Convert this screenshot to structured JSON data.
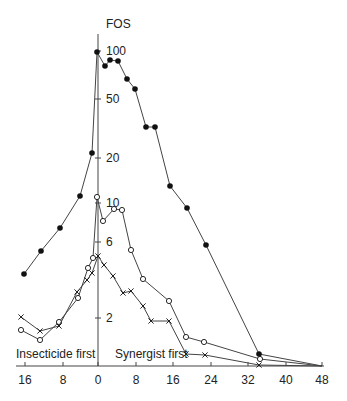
{
  "chart_data": {
    "type": "line",
    "title": "",
    "ylabel": "FOS",
    "xlabel": "",
    "yscale": "log",
    "ylim": [
      0.85,
      110
    ],
    "xlim": [
      -17,
      48
    ],
    "y_ticks": [
      {
        "value": 100,
        "label": "100",
        "py": 51
      },
      {
        "value": 50,
        "label": "50",
        "py": 99
      },
      {
        "value": 20,
        "label": "20",
        "py": 158
      },
      {
        "value": 10,
        "label": "10",
        "py": 203
      },
      {
        "value": 6,
        "label": "6",
        "py": 242
      },
      {
        "value": 2,
        "label": "2",
        "py": 318
      }
    ],
    "x_ticks": [
      {
        "value": -16,
        "label": "16",
        "px": 25
      },
      {
        "value": -8,
        "label": "8",
        "px": 63
      },
      {
        "value": 0,
        "label": "0",
        "px": 98
      },
      {
        "value": 8,
        "label": "8",
        "px": 136
      },
      {
        "value": 16,
        "label": "16",
        "px": 173
      },
      {
        "value": 24,
        "label": "24",
        "px": 211
      },
      {
        "value": 32,
        "label": "32",
        "px": 248
      },
      {
        "value": 40,
        "label": "40",
        "px": 286
      },
      {
        "value": 48,
        "label": "48",
        "px": 322
      }
    ],
    "annotations": [
      {
        "text": "Insecticide first",
        "region": "x < 0"
      },
      {
        "text": "Synergist first",
        "region": "x > 0"
      }
    ],
    "grid": false,
    "legend": null,
    "series": [
      {
        "name": "filled-circles",
        "marker": "filled-circle",
        "x": [
          -16,
          -12,
          -8,
          -4,
          -1,
          0,
          1.5,
          2.5,
          4,
          6,
          8,
          10,
          12,
          15,
          19,
          23,
          34,
          48
        ],
        "values": [
          3.4,
          4.8,
          6.9,
          11,
          21,
          100,
          80,
          87,
          86,
          65,
          56,
          32,
          32,
          13,
          9.3,
          5.3,
          1.0,
          0.85
        ],
        "px": [
          [
            24,
            274
          ],
          [
            41,
            251
          ],
          [
            60,
            228
          ],
          [
            80,
            196
          ],
          [
            92,
            153
          ],
          [
            97,
            52
          ],
          [
            105,
            66
          ],
          [
            110,
            60
          ],
          [
            118,
            61
          ],
          [
            127,
            79
          ],
          [
            135,
            89
          ],
          [
            146,
            127
          ],
          [
            155,
            127
          ],
          [
            170,
            186
          ],
          [
            187,
            208
          ],
          [
            206,
            245
          ],
          [
            259,
            354
          ],
          [
            322,
            366
          ]
        ]
      },
      {
        "name": "open-circles",
        "marker": "open-circle",
        "x": [
          -16,
          -12,
          -8,
          -4,
          -2,
          -1,
          0,
          1.5,
          3.5,
          5,
          7,
          9.5,
          15,
          19,
          23,
          34,
          48
        ],
        "values": [
          1.5,
          1.26,
          1.6,
          2.4,
          3.7,
          4.3,
          11,
          7.6,
          9.1,
          9.0,
          4.9,
          3.1,
          2.3,
          1.3,
          1.2,
          0.94,
          0.85
        ],
        "px": [
          [
            21,
            330
          ],
          [
            40,
            340
          ],
          [
            59,
            322
          ],
          [
            78,
            298
          ],
          [
            88,
            268
          ],
          [
            93,
            258
          ],
          [
            97,
            197
          ],
          [
            103,
            221
          ],
          [
            114,
            209
          ],
          [
            122,
            210
          ],
          [
            131,
            250
          ],
          [
            143,
            279
          ],
          [
            169,
            301
          ],
          [
            186,
            337
          ],
          [
            204,
            342
          ],
          [
            260,
            359
          ],
          [
            322,
            366
          ]
        ]
      },
      {
        "name": "crosses",
        "marker": "cross",
        "x": [
          -16,
          -12,
          -8,
          -4,
          -2,
          -1,
          0,
          1,
          3,
          5,
          7,
          9.5,
          11,
          15,
          19,
          23,
          34,
          48
        ],
        "values": [
          1.8,
          1.4,
          1.5,
          2.6,
          3.1,
          3.4,
          4.5,
          4.0,
          3.3,
          2.6,
          2.7,
          2.1,
          1.7,
          1.7,
          1.0,
          1.0,
          0.87,
          0.85
        ],
        "px": [
          [
            21,
            317
          ],
          [
            40,
            331
          ],
          [
            59,
            326
          ],
          [
            77,
            292
          ],
          [
            87,
            280
          ],
          [
            92,
            273
          ],
          [
            98,
            256
          ],
          [
            104,
            265
          ],
          [
            113,
            276
          ],
          [
            123,
            293
          ],
          [
            131,
            291
          ],
          [
            143,
            306
          ],
          [
            151,
            321
          ],
          [
            169,
            321
          ],
          [
            186,
            354
          ],
          [
            205,
            355
          ],
          [
            259,
            365
          ],
          [
            322,
            366
          ]
        ]
      }
    ]
  },
  "labels": {
    "y_axis_title": "FOS",
    "insecticide_first": "Insecticide first",
    "synergist_first": "Synergist first"
  },
  "colors": {
    "line": "#444444",
    "marker": "#111111",
    "text": "#222222",
    "background": "#ffffff"
  }
}
